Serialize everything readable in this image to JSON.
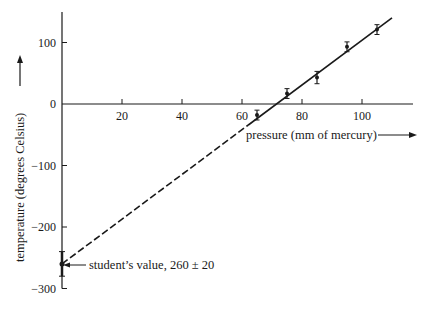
{
  "chart_data": {
    "type": "scatter",
    "title": "",
    "xlabel": "pressure (mm of mercury)",
    "ylabel": "temperature (degrees Celsius)",
    "xlim": [
      0,
      115
    ],
    "ylim": [
      -300,
      150
    ],
    "x_ticks": [
      20,
      40,
      60,
      80,
      100
    ],
    "y_ticks": [
      100,
      0,
      -100,
      -200,
      -300
    ],
    "x_tick_labels": [
      "20",
      "40",
      "60",
      "80",
      "100"
    ],
    "y_tick_labels": [
      "100",
      "0",
      "−100",
      "−200",
      "−300"
    ],
    "grid": false,
    "legend": null,
    "series": [
      {
        "name": "measurements",
        "x": [
          65,
          75,
          85,
          95,
          105
        ],
        "y": [
          -18,
          17,
          43,
          93,
          121
        ],
        "y_err": [
          8,
          8,
          10,
          8,
          8
        ]
      }
    ],
    "fit_line": {
      "style": "solid over data, dashed extrapolation",
      "from": [
        0,
        -260
      ],
      "to": [
        110,
        140
      ]
    },
    "annotations": [
      {
        "text": "student’s value, 260 ± 20",
        "x": 0,
        "y": -260,
        "error": 20
      }
    ]
  },
  "labels": {
    "annotation": "student’s value, 260 ± 20",
    "xlabel": "pressure (mm of mercury)",
    "ylabel": "temperature (degrees Celsius)"
  }
}
